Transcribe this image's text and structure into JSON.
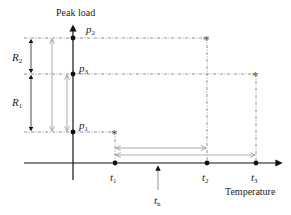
{
  "diagram": {
    "y_axis_label": "Peak load",
    "x_axis_label": "Temperature",
    "load_levels": [
      {
        "id": "p2",
        "symbol": "p",
        "sub": "2"
      },
      {
        "id": "p3",
        "symbol": "p",
        "sub": "3"
      },
      {
        "id": "p1",
        "symbol": "p",
        "sub": "1"
      }
    ],
    "temperatures": [
      {
        "id": "t1",
        "symbol": "t",
        "sub": "1"
      },
      {
        "id": "t2",
        "symbol": "t",
        "sub": "2"
      },
      {
        "id": "t3",
        "symbol": "t",
        "sub": "3"
      },
      {
        "id": "th",
        "symbol": "t",
        "sub": "h"
      }
    ],
    "ranges": [
      {
        "id": "R2",
        "symbol": "R",
        "sub": "2",
        "from": "p3",
        "to": "p2"
      },
      {
        "id": "R1",
        "symbol": "R",
        "sub": "1",
        "from": "p1",
        "to": "p3"
      }
    ],
    "points": [
      {
        "temperature": "t1",
        "load": "p1",
        "marker": "*"
      },
      {
        "temperature": "t2",
        "load": "p2",
        "marker": "*"
      },
      {
        "temperature": "t3",
        "load": "p3",
        "marker": "*"
      }
    ],
    "colors": {
      "axis": "#111111",
      "dashed": "#777777",
      "gray_arrow": "#999999"
    }
  }
}
